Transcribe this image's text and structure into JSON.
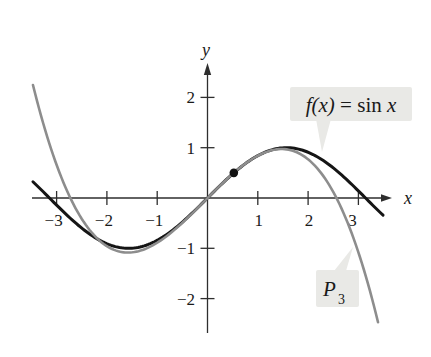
{
  "figure": {
    "background": "#ffffff",
    "axis": {
      "color": "#2e2e2e",
      "x_label": "x",
      "y_label": "y",
      "x_ticks": [
        {
          "value": -3,
          "label": "−3",
          "dx": -3
        },
        {
          "value": -2,
          "label": "−2",
          "dx": -3
        },
        {
          "value": -1,
          "label": "−1",
          "dx": -3
        },
        {
          "value": 1,
          "label": "1",
          "dx": 1
        },
        {
          "value": 2,
          "label": "2",
          "dx": 1
        },
        {
          "value": 3,
          "label": "3",
          "dx": -6
        }
      ],
      "y_ticks": [
        {
          "value": 2,
          "label": "2"
        },
        {
          "value": 1,
          "label": "1"
        },
        {
          "value": -1,
          "label": "−1"
        },
        {
          "value": -2,
          "label": "−2"
        }
      ]
    },
    "callouts": {
      "bg": "#e9e9e6",
      "f_label_text": "f(x) = sin x",
      "f_label_parts": [
        {
          "text": "f(x)",
          "italic": true
        },
        {
          "text": " = sin ",
          "italic": false
        },
        {
          "text": "x",
          "italic": true
        }
      ],
      "p_label_base": "P",
      "p_label_sub": "3"
    }
  },
  "chart_data": {
    "type": "line",
    "x_range": [
      -3.5,
      3.65
    ],
    "y_range": [
      -2.7,
      2.75
    ],
    "grid": false,
    "x_tick_values": [
      -3,
      -2,
      -1,
      1,
      2,
      3
    ],
    "y_tick_values": [
      -2,
      -1,
      1,
      2
    ],
    "series": [
      {
        "name": "f(x) = sin x",
        "fn": "sin",
        "domain": [
          -3.47,
          3.49
        ],
        "color": "#151515",
        "stroke_width": 3
      },
      {
        "name": "P3",
        "fn": "poly",
        "description": "third Taylor polynomial of sin x centered at pi/6",
        "center": 0.5235988,
        "coeffs": [
          0.5,
          0.8660254,
          -0.25,
          -0.1443376
        ],
        "domain": [
          -3.47,
          3.39
        ],
        "color": "#8d8d8d",
        "stroke_width": 2.6
      }
    ],
    "marked_point": {
      "x": 0.5235988,
      "y": 0.5,
      "color": "#111111"
    }
  }
}
